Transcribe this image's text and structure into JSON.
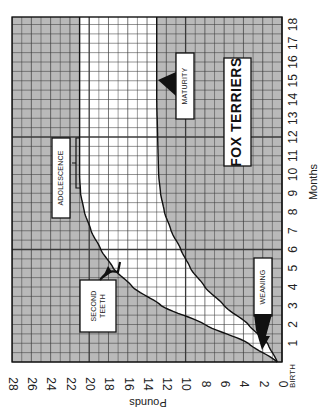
{
  "chart_data": {
    "type": "line",
    "title": "FOX TERRIERS",
    "orientation": "rotated 90 degrees clockwise (months axis vertical on right, pounds axis horizontal at bottom)",
    "xlabel": "Months",
    "ylabel": "Pounds",
    "x_ticks": [
      "BIRTH",
      "1",
      "2",
      "3",
      "4",
      "5",
      "6",
      "7",
      "8",
      "9",
      "10",
      "11",
      "12",
      "13",
      "14",
      "15",
      "16",
      "17",
      "18"
    ],
    "y_ticks": [
      "0",
      "2",
      "4",
      "6",
      "8",
      "10",
      "12",
      "14",
      "16",
      "18",
      "20",
      "22",
      "24",
      "26",
      "28"
    ],
    "xlim": [
      0,
      18.5
    ],
    "ylim": [
      0,
      28
    ],
    "grid": true,
    "major_gridlines": {
      "months": [
        6,
        12
      ],
      "pounds": [
        10,
        20
      ]
    },
    "x": [
      0,
      1,
      2,
      3,
      4,
      5,
      6,
      7,
      8,
      9,
      10,
      12,
      14,
      16,
      18
    ],
    "series": [
      {
        "name": "Upper weight range",
        "values": [
          0.5,
          3.5,
          8,
          12.5,
          15.5,
          17.5,
          18.8,
          19.8,
          20.5,
          20.9,
          21,
          21,
          21,
          21,
          21
        ]
      },
      {
        "name": "Lower weight range",
        "values": [
          0.5,
          1.5,
          3.5,
          6,
          8,
          9.5,
          10.5,
          11.5,
          12.2,
          12.6,
          12.8,
          12.9,
          13,
          13,
          13
        ]
      }
    ],
    "annotations": [
      {
        "text": "WEANING",
        "month": 1.5,
        "pounds": 2.5
      },
      {
        "text": "SECOND TEETH",
        "month_range": [
          4.5,
          5.8
        ],
        "pounds": 17
      },
      {
        "text": "ADOLESCENCE",
        "month_range": [
          9,
          12
        ],
        "pounds": 21
      },
      {
        "text": "MATURITY",
        "month": 15,
        "pounds": 13
      }
    ]
  },
  "labels": {
    "title": "FOX TERRIERS",
    "months_axis": "Months",
    "pounds_axis": "Pounds",
    "birth": "BIRTH",
    "weaning": "WEANING",
    "second_teeth_1": "SECOND",
    "second_teeth_2": "TEETH",
    "adolescence": "ADOLESCENCE",
    "maturity": "MATURITY"
  },
  "colors": {
    "shaded": "#b9b9b9",
    "band": "#ffffff",
    "grid": "#3a3a3a",
    "ink": "#111111"
  }
}
